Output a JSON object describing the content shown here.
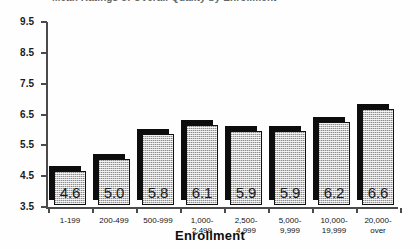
{
  "figure": {
    "title_partial": "Mean Ratings of Overall Quality by Enrollment",
    "xaxis_title": "Enrollment"
  },
  "chart_data": {
    "type": "bar",
    "title": "Mean Ratings of Overall Quality by Enrollment",
    "xlabel": "Enrollment",
    "ylabel": "",
    "ylim": [
      3.5,
      9.5
    ],
    "ytick_labels": [
      "9.5",
      "8.5",
      "7.5",
      "6.5",
      "5.5",
      "4.5",
      "3.5"
    ],
    "yticks": [
      9.5,
      8.5,
      7.5,
      6.5,
      5.5,
      4.5,
      3.5
    ],
    "grid": false,
    "legend": null,
    "categories": [
      "1-199",
      "200-499",
      "500-999",
      "1,000-\n2,499",
      "2,500-\n4,999",
      "5,000-\n9,999",
      "10,000-\n19,999",
      "20,000-\nover"
    ],
    "values": [
      4.6,
      5.0,
      5.8,
      6.1,
      5.9,
      5.9,
      6.2,
      6.6
    ],
    "value_labels": [
      "4.6",
      "5.0",
      "5.8",
      "6.1",
      "5.9",
      "5.9",
      "6.2",
      "6.6"
    ],
    "colors": {
      "bar_face": "#c9c9c9",
      "bar_edge": "#101010",
      "bar_shadow": "#0d0d0d",
      "axis": "#4a4a4a",
      "text": "#1a1a1a"
    }
  }
}
